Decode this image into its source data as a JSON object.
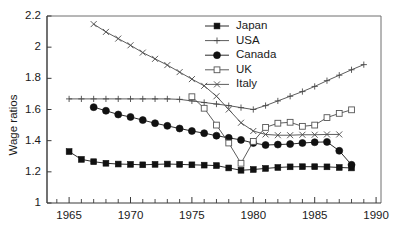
{
  "chart_data": {
    "type": "line",
    "title": "",
    "xlabel": "",
    "ylabel": "Wage ratios",
    "xlim": [
      1963.2,
      1990.4
    ],
    "ylim": [
      1.0,
      2.2
    ],
    "x_ticks_major": [
      1965,
      1970,
      1975,
      1980,
      1985,
      1990
    ],
    "x_tick_labels": [
      "1965",
      "1970",
      "1975",
      "1980",
      "1985",
      "1990"
    ],
    "y_ticks": [
      1,
      1.2,
      1.4,
      1.6,
      1.8,
      2,
      2.2
    ],
    "y_tick_labels": [
      "1",
      "1.2",
      "1.4",
      "1.6",
      "1.8",
      "2",
      "2.2"
    ],
    "x_minor_step": 1,
    "grid": false,
    "legend_position": "top-center-right",
    "series": [
      {
        "name": "Japan",
        "marker": "filled-square",
        "x": [
          1965,
          1966,
          1967,
          1968,
          1969,
          1970,
          1971,
          1972,
          1973,
          1974,
          1975,
          1976,
          1977,
          1978,
          1979,
          1980,
          1981,
          1982,
          1983,
          1984,
          1985,
          1986,
          1987,
          1988
        ],
        "y": [
          1.33,
          1.28,
          1.265,
          1.255,
          1.25,
          1.248,
          1.245,
          1.248,
          1.25,
          1.248,
          1.245,
          1.243,
          1.24,
          1.225,
          1.21,
          1.215,
          1.222,
          1.228,
          1.232,
          1.233,
          1.233,
          1.232,
          1.228,
          1.225
        ]
      },
      {
        "name": "USA",
        "marker": "plus",
        "x": [
          1965,
          1966,
          1967,
          1968,
          1969,
          1970,
          1971,
          1972,
          1973,
          1974,
          1975,
          1976,
          1977,
          1978,
          1979,
          1980,
          1981,
          1982,
          1983,
          1984,
          1985,
          1986,
          1987,
          1988,
          1989
        ],
        "y": [
          1.668,
          1.668,
          1.668,
          1.668,
          1.668,
          1.668,
          1.668,
          1.668,
          1.668,
          1.665,
          1.655,
          1.645,
          1.635,
          1.625,
          1.612,
          1.6,
          1.625,
          1.655,
          1.685,
          1.715,
          1.748,
          1.785,
          1.82,
          1.855,
          1.888
        ]
      },
      {
        "name": "Canada",
        "marker": "filled-circle",
        "x": [
          1967,
          1968,
          1969,
          1970,
          1971,
          1972,
          1973,
          1974,
          1975,
          1976,
          1977,
          1978,
          1979,
          1980,
          1981,
          1982,
          1983,
          1984,
          1985,
          1986,
          1987,
          1988
        ],
        "y": [
          1.615,
          1.592,
          1.568,
          1.552,
          1.532,
          1.512,
          1.495,
          1.478,
          1.462,
          1.448,
          1.432,
          1.418,
          1.405,
          1.385,
          1.372,
          1.375,
          1.378,
          1.385,
          1.39,
          1.392,
          1.335,
          1.245
        ]
      },
      {
        "name": "UK",
        "marker": "open-square",
        "x": [
          1975,
          1976,
          1977,
          1978,
          1979,
          1980,
          1981,
          1982,
          1983,
          1984,
          1985,
          1986,
          1987,
          1988
        ],
        "y": [
          1.682,
          1.608,
          1.5,
          1.385,
          1.255,
          1.395,
          1.485,
          1.512,
          1.518,
          1.492,
          1.5,
          1.548,
          1.575,
          1.598
        ]
      },
      {
        "name": "Italy",
        "marker": "x",
        "x": [
          1967,
          1968,
          1969,
          1970,
          1971,
          1972,
          1973,
          1974,
          1975,
          1976,
          1977,
          1978,
          1979,
          1980,
          1981,
          1982,
          1983,
          1984,
          1985,
          1986,
          1987
        ],
        "y": [
          2.148,
          2.098,
          2.055,
          2.012,
          1.965,
          1.925,
          1.885,
          1.84,
          1.795,
          1.752,
          1.685,
          1.6,
          1.515,
          1.462,
          1.44,
          1.435,
          1.435,
          1.438,
          1.438,
          1.44,
          1.44
        ]
      }
    ],
    "legend": [
      {
        "label": "Japan",
        "marker": "filled-square"
      },
      {
        "label": "USA",
        "marker": "plus"
      },
      {
        "label": "Canada",
        "marker": "filled-circle"
      },
      {
        "label": "UK",
        "marker": "open-square"
      },
      {
        "label": "Italy",
        "marker": "x"
      }
    ]
  }
}
